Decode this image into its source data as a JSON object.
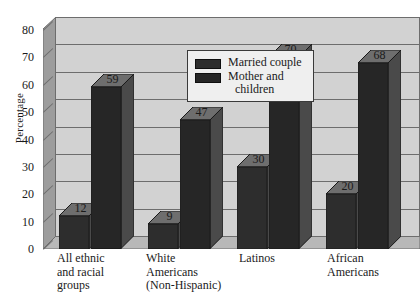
{
  "chart_data": {
    "type": "bar",
    "title": "",
    "subtitle": "",
    "xlabel": "",
    "ylabel": "Percentage",
    "ylim": [
      0,
      80
    ],
    "yticks": [
      80,
      70,
      60,
      50,
      40,
      30,
      20,
      10,
      0
    ],
    "grid": true,
    "legend_position": "top-center",
    "categories": [
      "All ethnic and racial groups",
      "White Americans (Non-Hispanic)",
      "Latinos",
      "African Americans"
    ],
    "category_lines": [
      [
        "All ethnic",
        "and racial",
        "groups"
      ],
      [
        "White",
        "Americans",
        "(Non-Hispanic)"
      ],
      [
        "Latinos"
      ],
      [
        "African",
        "Americans"
      ]
    ],
    "series": [
      {
        "name": "Married couple",
        "values": [
          12,
          9,
          30,
          20
        ],
        "color": "#2d2d2d"
      },
      {
        "name": "Mother and children",
        "values": [
          59,
          47,
          70,
          68
        ],
        "color": "#262626"
      }
    ],
    "legend": [
      {
        "label": "Married couple",
        "lines": [
          "Married couple"
        ]
      },
      {
        "label": "Mother and children",
        "lines": [
          "Mother and",
          "children"
        ]
      }
    ],
    "colors": {
      "plot_background": "#d2d2d2",
      "wall_shade": "#9d9d9d",
      "floor_shade": "#b8b8b8",
      "axis": "#6d6d6d",
      "text": "#1a1a1a"
    }
  }
}
